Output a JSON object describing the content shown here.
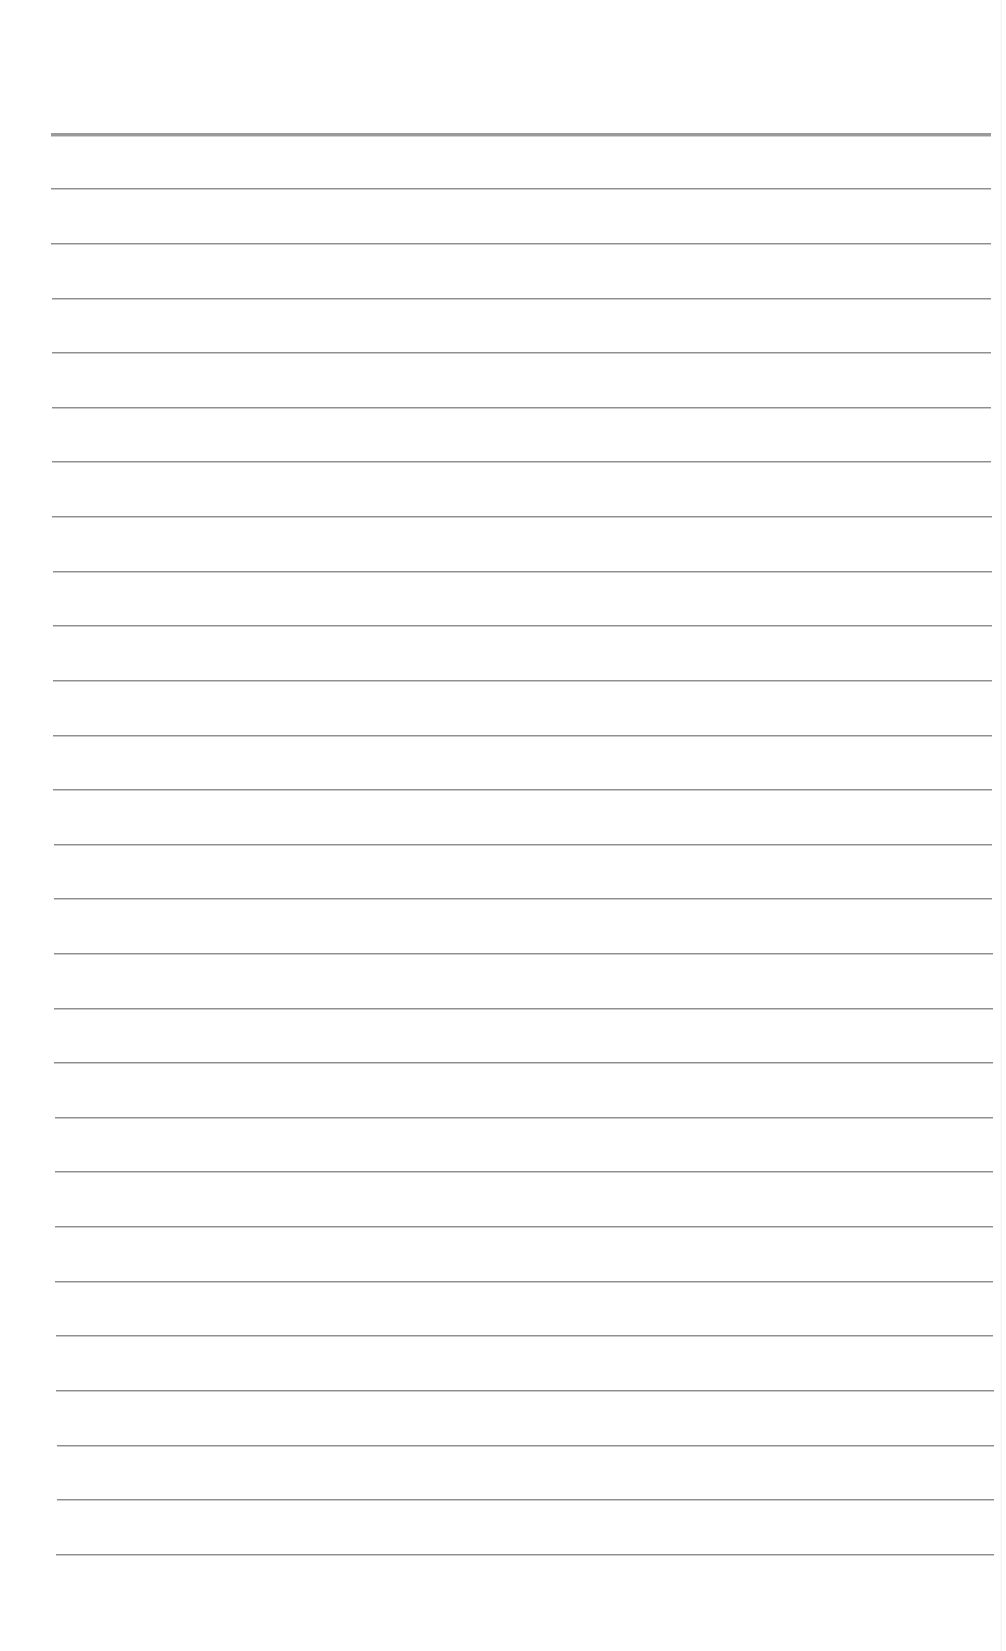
{
  "document": {
    "type": "lined-paper",
    "line_color": "#8f8f8f",
    "header_line_color": "#9a9a9a",
    "background": "#ffffff",
    "header_rule": {
      "y": 133,
      "x1": 51,
      "x2": 991,
      "thickness": 3
    },
    "rules": [
      {
        "y": 188,
        "x1": 51,
        "x2": 991
      },
      {
        "y": 243,
        "x1": 51,
        "x2": 991
      },
      {
        "y": 298,
        "x1": 52,
        "x2": 991
      },
      {
        "y": 352,
        "x1": 52,
        "x2": 991
      },
      {
        "y": 407,
        "x1": 52,
        "x2": 991
      },
      {
        "y": 461,
        "x1": 52,
        "x2": 991
      },
      {
        "y": 516,
        "x1": 52,
        "x2": 992
      },
      {
        "y": 571,
        "x1": 53,
        "x2": 992
      },
      {
        "y": 625,
        "x1": 53,
        "x2": 992
      },
      {
        "y": 680,
        "x1": 53,
        "x2": 992
      },
      {
        "y": 735,
        "x1": 53,
        "x2": 992
      },
      {
        "y": 789,
        "x1": 53,
        "x2": 992
      },
      {
        "y": 844,
        "x1": 54,
        "x2": 992
      },
      {
        "y": 898,
        "x1": 54,
        "x2": 992
      },
      {
        "y": 953,
        "x1": 54,
        "x2": 993
      },
      {
        "y": 1008,
        "x1": 54,
        "x2": 993
      },
      {
        "y": 1062,
        "x1": 54,
        "x2": 993
      },
      {
        "y": 1117,
        "x1": 55,
        "x2": 993
      },
      {
        "y": 1171,
        "x1": 55,
        "x2": 993
      },
      {
        "y": 1226,
        "x1": 55,
        "x2": 993
      },
      {
        "y": 1281,
        "x1": 55,
        "x2": 993
      },
      {
        "y": 1335,
        "x1": 56,
        "x2": 993
      },
      {
        "y": 1390,
        "x1": 56,
        "x2": 994
      },
      {
        "y": 1445,
        "x1": 57,
        "x2": 994
      },
      {
        "y": 1499,
        "x1": 57,
        "x2": 994
      },
      {
        "y": 1554,
        "x1": 56,
        "x2": 994
      }
    ]
  }
}
